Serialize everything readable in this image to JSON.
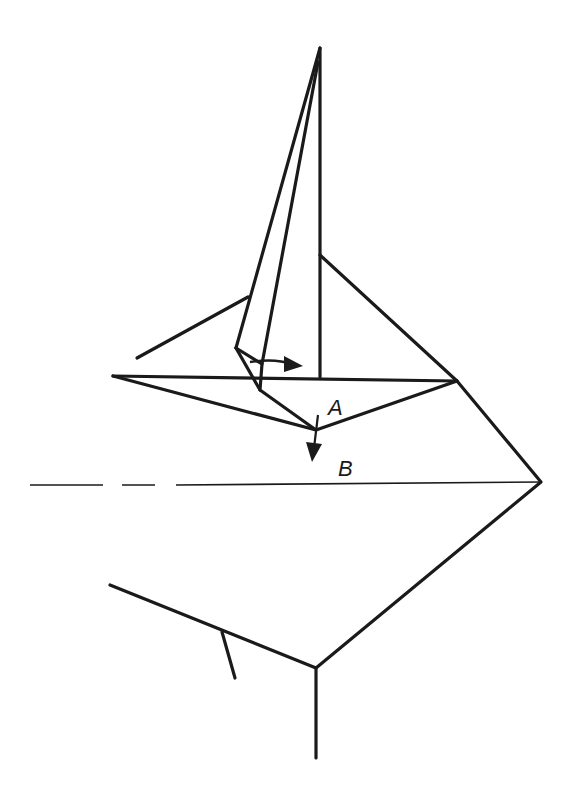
{
  "diagram": {
    "type": "origami-fold-step",
    "labels": {
      "a": "A",
      "b": "B"
    },
    "colors": {
      "line": "#1a1a1a",
      "background": "#ffffff"
    },
    "arrows": [
      {
        "name": "swing-right-arrow",
        "meaning": "move flap to the right"
      },
      {
        "name": "fold-down-arrow",
        "meaning": "fold point A down to line B"
      }
    ],
    "lines": [
      {
        "name": "reference-line-b",
        "style": "dashed-then-solid"
      }
    ]
  }
}
